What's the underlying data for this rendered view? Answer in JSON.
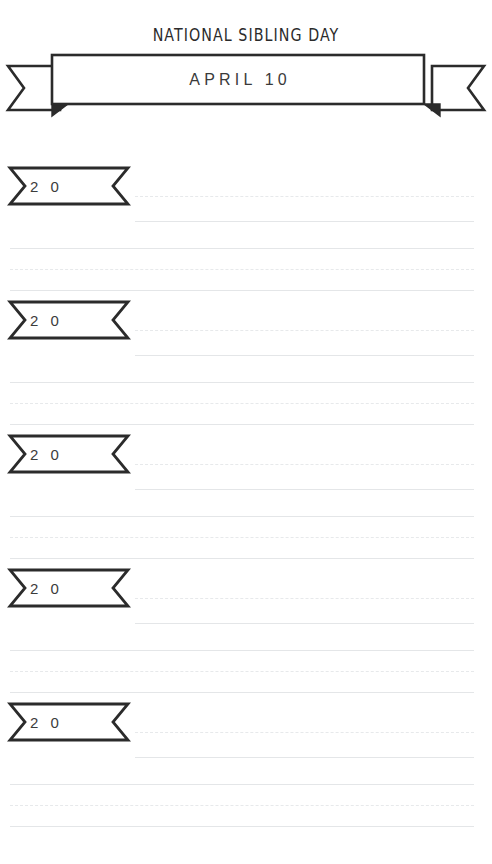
{
  "page": {
    "background_color": "#ffffff",
    "ink_color": "#2b2b2b",
    "rule_color": "#e4e6e8",
    "width": 492,
    "height": 864
  },
  "header": {
    "title": "NATIONAL SIBLING DAY",
    "date": "APRIL 10",
    "ribbon_icon": "ribbon-banner-icon"
  },
  "entries": [
    {
      "year": "2 0",
      "ribbon_icon": "year-ribbon-icon",
      "short_lines": 2,
      "full_lines": 3
    },
    {
      "year": "2 0",
      "ribbon_icon": "year-ribbon-icon",
      "short_lines": 2,
      "full_lines": 3
    },
    {
      "year": "2 0",
      "ribbon_icon": "year-ribbon-icon",
      "short_lines": 2,
      "full_lines": 3
    },
    {
      "year": "2 0",
      "ribbon_icon": "year-ribbon-icon",
      "short_lines": 2,
      "full_lines": 3
    },
    {
      "year": "2 0",
      "ribbon_icon": "year-ribbon-icon",
      "short_lines": 2,
      "full_lines": 3
    }
  ]
}
